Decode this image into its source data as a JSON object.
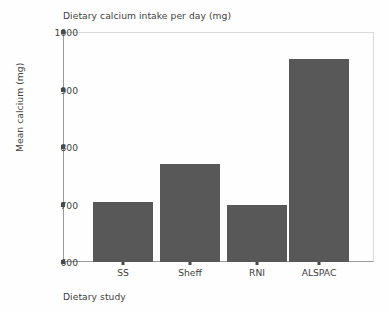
{
  "chart_data": {
    "type": "bar",
    "title": "Dietary calcium intake per day (mg)",
    "xlabel": "Dietary study",
    "ylabel": "Mean calcium (mg)",
    "categories": [
      "SS",
      "Sheff",
      "RNI",
      "ALSPAC"
    ],
    "values": [
      704,
      770,
      700,
      953
    ],
    "ylim": [
      600,
      1000
    ],
    "yticks": [
      600,
      700,
      800,
      900,
      1000
    ],
    "ytick_labels": [
      "600",
      "700",
      "800",
      "900",
      "1000"
    ],
    "grid": false,
    "legend": null,
    "bar_color": "#585858",
    "axis_color": "#9a9a9a",
    "text_color": "#3f3f3f"
  }
}
